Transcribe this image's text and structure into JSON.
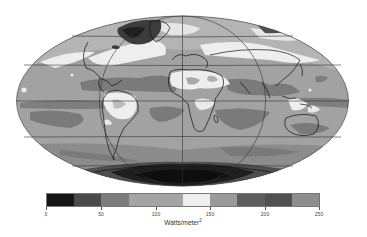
{
  "figure": {
    "type": "map",
    "projection": "Mollweide (global, equal-area)",
    "variable": "radiative flux",
    "units_label": "Watts/meter",
    "units_superscript": "2"
  },
  "colorbar": {
    "min": 0,
    "max": 250,
    "ticks": [
      {
        "value": 0,
        "label": "0"
      },
      {
        "value": 50,
        "label": "50"
      },
      {
        "value": 100,
        "label": "100"
      },
      {
        "value": 150,
        "label": "150"
      },
      {
        "value": 200,
        "label": "200"
      },
      {
        "value": 250,
        "label": "250"
      }
    ],
    "segments": [
      {
        "from": 0,
        "to": 25,
        "color": "#161616"
      },
      {
        "from": 25,
        "to": 50,
        "color": "#4a4a4a"
      },
      {
        "from": 50,
        "to": 75,
        "color": "#7c7c7c"
      },
      {
        "from": 75,
        "to": 125,
        "color": "#a4a4a4"
      },
      {
        "from": 125,
        "to": 150,
        "color": "#efefef"
      },
      {
        "from": 150,
        "to": 175,
        "color": "#9a9a9a"
      },
      {
        "from": 175,
        "to": 200,
        "color": "#5e5e5e"
      },
      {
        "from": 200,
        "to": 225,
        "color": "#505050"
      },
      {
        "from": 225,
        "to": 250,
        "color": "#8e8e8e"
      }
    ]
  },
  "map_colors": {
    "ocean_base": "#a2a2a2",
    "dark_band": "#7a7a7a",
    "bright": "#eeeeee",
    "antarctic": "#1e1e1e",
    "greenland": "#3c3c3c",
    "grid": "#333333",
    "coast": "#111111"
  },
  "grid": {
    "parallels": [
      "60N",
      "30N",
      "Equator",
      "30S",
      "60S"
    ],
    "meridians": [
      "90W",
      "0",
      "90E"
    ]
  }
}
